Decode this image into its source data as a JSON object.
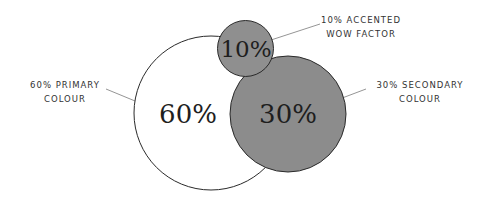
{
  "diagram": {
    "colors": {
      "primary_fill": "#ffffff",
      "secondary_fill": "#8c8c8c",
      "accent_fill": "#8f8f8f",
      "stroke": "#2a2a2a",
      "leader": "#7a7a7a"
    },
    "circles": [
      {
        "id": "primary",
        "value": "60%",
        "label_line1": "60% PRIMARY",
        "label_line2": "COLOUR"
      },
      {
        "id": "secondary",
        "value": "30%",
        "label_line1": "30% SECONDARY",
        "label_line2": "COLOUR"
      },
      {
        "id": "accent",
        "value": "10%",
        "label_line1": "10% ACCENTED",
        "label_line2": "WOW FACTOR"
      }
    ]
  }
}
